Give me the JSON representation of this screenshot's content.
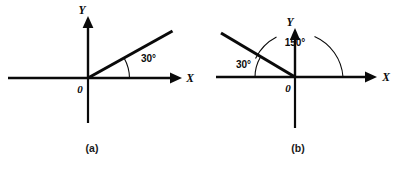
{
  "figure": {
    "background_color": "#ffffff",
    "ink_color": "#0a0a0a",
    "width": 408,
    "height": 169
  },
  "panels": [
    {
      "id": "panel-a",
      "caption": "(a)",
      "origin_label": "0",
      "x_axis_label": "X",
      "y_axis_label": "Y",
      "angle_label": "30°",
      "angle_degrees": 30,
      "description": "Angle of 30 degrees measured counterclockwise from the positive X axis to a ray in the first quadrant"
    },
    {
      "id": "panel-b",
      "caption": "(b)",
      "origin_label": "0",
      "x_axis_label": "X",
      "y_axis_label": "Y",
      "angle_label_inner": "30°",
      "angle_label_outer": "150°",
      "angle_inner_degrees": 30,
      "angle_outer_degrees": 150,
      "description": "Ray in the second quadrant making 30 degrees with the negative X axis and 150 degrees measured counterclockwise from the positive X axis"
    }
  ]
}
